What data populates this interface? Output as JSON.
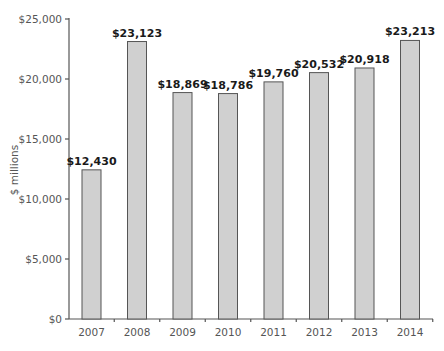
{
  "chart_data": {
    "type": "bar",
    "title": "",
    "xlabel": "",
    "ylabel": "$ millions",
    "categories": [
      "2007",
      "2008",
      "2009",
      "2010",
      "2011",
      "2012",
      "2013",
      "2014"
    ],
    "values": [
      12430,
      23123,
      18869,
      18786,
      19760,
      20532,
      20918,
      23213
    ],
    "value_labels": [
      "$12,430",
      "$23,123",
      "$18,869",
      "$18,786",
      "$19,760",
      "$20,532",
      "$20,918",
      "$23,213"
    ],
    "ylim": [
      0,
      25000
    ],
    "yticks": [
      0,
      5000,
      10000,
      15000,
      20000,
      25000
    ],
    "ytick_labels": [
      "$0",
      "$5,000",
      "$10,000",
      "$15,000",
      "$20,000",
      "$25,000"
    ],
    "grid": false,
    "legend": null,
    "colors": {
      "bar_fill": "#d0d0d0",
      "bar_stroke": "#555555",
      "axis": "#555555",
      "label": "#1a1a1a"
    }
  }
}
